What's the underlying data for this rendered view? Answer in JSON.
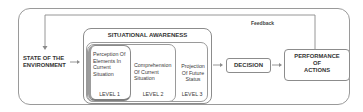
{
  "diagram": {
    "feedback_label": "Feedback",
    "state": {
      "line1": "STATE OF THE",
      "line2": "ENVIRONMENT"
    },
    "situational_awareness": {
      "title": "SITUATIONAL AWARENESS",
      "levels": [
        {
          "lines": [
            "Perception Of",
            "Elements In",
            "Current",
            "Situation"
          ],
          "level": "LEVEL 1"
        },
        {
          "lines": [
            "Comprehension",
            "Of Current",
            "Situation"
          ],
          "level": "LEVEL 2"
        },
        {
          "lines": [
            "Projection",
            "Of Future",
            "Status"
          ],
          "level": "LEVEL 3"
        }
      ]
    },
    "decision": "DECISION",
    "performance": {
      "line1": "PERFORMANCE",
      "line2": "OF",
      "line3": "ACTIONS"
    }
  },
  "colors": {
    "stroke": "#8c8c8c",
    "text": "#333333",
    "background": "#ffffff"
  }
}
